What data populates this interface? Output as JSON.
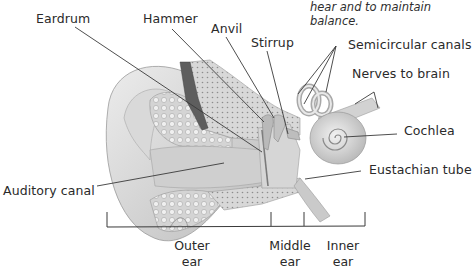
{
  "caption": {
    "line1": "hear and to maintain",
    "line2": "balance."
  },
  "labels": {
    "eardrum": "Eardrum",
    "hammer": "Hammer",
    "anvil": "Anvil",
    "stirrup": "Stirrup",
    "semicircular_canals": "Semicircular canals",
    "nerves_to_brain": "Nerves to brain",
    "cochlea": "Cochlea",
    "eustachian_tube": "Eustachian tube",
    "auditory_canal": "Auditory canal"
  },
  "regions": [
    {
      "line1": "Outer",
      "line2": "ear"
    },
    {
      "line1": "Middle",
      "line2": "ear"
    },
    {
      "line1": "Inner",
      "line2": "ear"
    }
  ],
  "colors": {
    "text": "#2a2a2a",
    "leader": "#3a3a3a",
    "tissue_light": "#e6e6e6",
    "tissue_mid": "#c9c9c9",
    "tissue_dark": "#8a8a8a",
    "canal_dark": "#5e5e5e"
  }
}
